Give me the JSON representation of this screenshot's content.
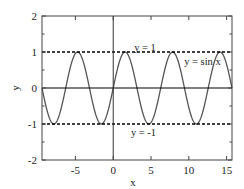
{
  "chart_data": {
    "type": "line",
    "title": "",
    "xlabel": "x",
    "ylabel": "y",
    "xlim": [
      -9.42,
      15.71
    ],
    "ylim": [
      -2,
      2
    ],
    "xticks": [
      -5,
      0,
      5,
      10,
      15
    ],
    "xtick_labels": [
      "-5",
      "0",
      "5",
      "10",
      "15"
    ],
    "yticks": [
      -2,
      -1,
      0,
      1,
      2
    ],
    "ytick_labels": [
      "-2",
      "-1",
      "0",
      "1",
      "2"
    ],
    "y_minor_step": 0.5,
    "grid": false,
    "legend": null,
    "series": [
      {
        "name": "y = sin x",
        "function": "sin",
        "x_range": [
          -9.42,
          15.71
        ],
        "color": "#555555",
        "style": "solid"
      },
      {
        "name": "y = 1",
        "constant": 1,
        "color": "#000000",
        "style": "dashed"
      },
      {
        "name": "y = -1",
        "constant": -1,
        "color": "#000000",
        "style": "dashed"
      },
      {
        "name": "y = 0",
        "constant": 0,
        "color": "#000000",
        "style": "solid"
      }
    ],
    "reference_lines": {
      "x_axis_at": 0,
      "y_axis_at": 0
    },
    "annotations": [
      {
        "text": "y = 1",
        "x": 4.2,
        "y": 1.1
      },
      {
        "text": "y = sin x",
        "x": 11.8,
        "y": 0.72
      },
      {
        "text": "y = -1",
        "x": 4.0,
        "y": -1.25
      }
    ]
  }
}
